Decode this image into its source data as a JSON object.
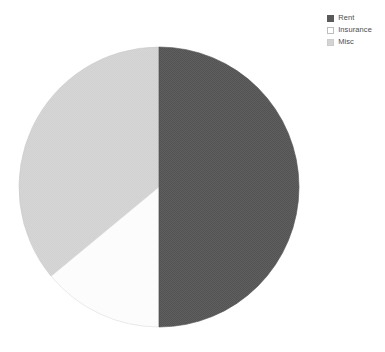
{
  "chart_data": {
    "type": "pie",
    "title": "",
    "subtitle": "",
    "xlabel": "",
    "ylabel": "",
    "grid": false,
    "legend_position": "top-right",
    "categories": [
      "Rent",
      "Insurance",
      "Misc"
    ],
    "values": [
      50,
      14,
      36
    ],
    "unit": "percent",
    "series": [
      {
        "name": "Budget share",
        "values": [
          50,
          14,
          36
        ]
      }
    ],
    "slices": [
      {
        "label": "Rent",
        "value": 50,
        "percent": 50,
        "color": "#5a5a5a",
        "start_angle_deg": 0,
        "end_angle_deg": 180,
        "texture": "dithered"
      },
      {
        "label": "Insurance",
        "value": 14,
        "percent": 14,
        "color": "#fcfcfc",
        "start_angle_deg": 180,
        "end_angle_deg": 230,
        "texture": "solid"
      },
      {
        "label": "Misc",
        "value": 36,
        "percent": 36,
        "color": "#d4d4d4",
        "start_angle_deg": 230,
        "end_angle_deg": 360,
        "texture": "solid"
      }
    ],
    "geometry": {
      "center_x": 159,
      "center_y": 187,
      "radius": 140
    },
    "annotations": [],
    "data_labels_shown": false
  },
  "legend": {
    "items": [
      {
        "label": "Rent",
        "color": "#5a5a5a",
        "swatch": "filled-square"
      },
      {
        "label": "Insurance",
        "color": "#fcfcfc",
        "swatch": "outlined-square"
      },
      {
        "label": "Misc",
        "color": "#d4d4d4",
        "swatch": "filled-square"
      }
    ]
  },
  "canvas": {
    "background": "#ffffff",
    "outline_color": "#b4b4b4"
  }
}
